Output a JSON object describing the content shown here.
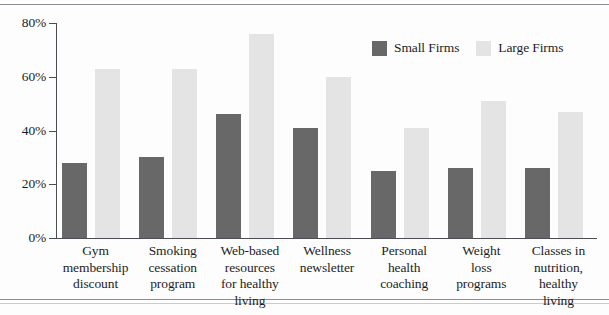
{
  "chart_data": {
    "type": "bar",
    "title": "",
    "subtitle": "",
    "xlabel": "",
    "ylabel": "",
    "ylim": [
      0,
      80
    ],
    "yticks": [
      "0%",
      "20%",
      "40%",
      "60%",
      "80%"
    ],
    "ytick_values": [
      0,
      20,
      40,
      60,
      80
    ],
    "grid": false,
    "legend_position": "top-right",
    "categories": [
      "Gym membership discount",
      "Smoking cessation program",
      "Web-based resources for healthy living",
      "Wellness newsletter",
      "Personal health coaching",
      "Weight loss programs",
      "Classes in nutrition, healthy living"
    ],
    "category_label_lines": [
      [
        "Gym",
        "membership",
        "discount"
      ],
      [
        "Smoking",
        "cessation",
        "program"
      ],
      [
        "Web-based",
        "resources",
        "for healthy",
        "living"
      ],
      [
        "Wellness",
        "newsletter"
      ],
      [
        "Personal",
        "health",
        "coaching"
      ],
      [
        "Weight",
        "loss",
        "programs"
      ],
      [
        "Classes in",
        "nutrition,",
        "healthy",
        "living"
      ]
    ],
    "series": [
      {
        "name": "Small Firms",
        "color": "#686868",
        "values": [
          28,
          30,
          46,
          41,
          25,
          26,
          26
        ]
      },
      {
        "name": "Large Firms",
        "color": "#e4e4e4",
        "values": [
          63,
          63,
          76,
          60,
          41,
          51,
          47
        ]
      }
    ]
  },
  "legend": {
    "entries": [
      {
        "label": "Small Firms",
        "color": "#686868"
      },
      {
        "label": "Large Firms",
        "color": "#e4e4e4"
      }
    ]
  },
  "axis": {
    "y_tick_labels": [
      "80%",
      "60%",
      "40%",
      "20%",
      "0%"
    ]
  },
  "colors": {
    "small_firms": "#686868",
    "large_firms": "#e4e4e4",
    "axis": "#4a4d52",
    "frame_rule": "#8a8d93",
    "text": "#1d1d1f",
    "background": "#fdfdfd"
  }
}
